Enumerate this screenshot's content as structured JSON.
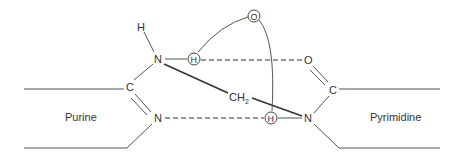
{
  "diagram": {
    "type": "chemical-structure",
    "labels": {
      "left_base": "Purine",
      "right_base": "Pyrimidine"
    },
    "atoms": {
      "h_top": "H",
      "n_upper": "N",
      "h_upper_circled": "H",
      "o_top_circled": "O",
      "o_right": "O",
      "c_left": "C",
      "c_right": "C",
      "ch2": "CH",
      "ch2_sub": "2",
      "n_lower_left": "N",
      "h_lower_circled": "H",
      "n_lower_right": "N"
    },
    "colors": {
      "line": "#555555",
      "text": "#333333",
      "background": "#ffffff"
    }
  }
}
